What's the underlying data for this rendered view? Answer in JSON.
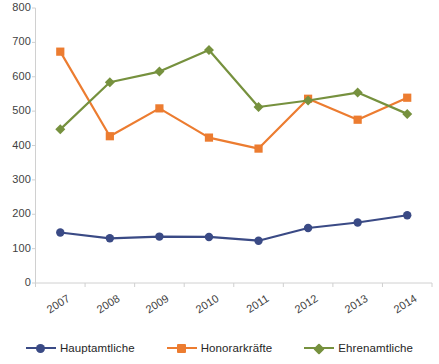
{
  "chart_data": {
    "type": "line",
    "title": "",
    "subtitle": "",
    "xlabel": "",
    "ylabel": "",
    "categories": [
      "2007",
      "2008",
      "2009",
      "2010",
      "2011",
      "2012",
      "2013",
      "2014"
    ],
    "ylim": [
      0,
      800
    ],
    "y_ticks": [
      0,
      100,
      200,
      300,
      400,
      500,
      600,
      700,
      800
    ],
    "y_tick_labels": [
      "0",
      "100",
      "200",
      "300",
      "400",
      "500",
      "600",
      "700",
      "800"
    ],
    "grid": false,
    "legend_position": "bottom",
    "series": [
      {
        "name": "Hauptamtliche",
        "color": "#3a4a85",
        "marker": "circle",
        "values": [
          147,
          130,
          135,
          134,
          123,
          160,
          176,
          197
        ]
      },
      {
        "name": "Honorarkräfte",
        "color": "#ec7c30",
        "marker": "square",
        "values": [
          673,
          427,
          508,
          423,
          391,
          536,
          475,
          539
        ]
      },
      {
        "name": "Ehrenamtliche",
        "color": "#76913e",
        "marker": "diamond",
        "values": [
          447,
          584,
          615,
          678,
          512,
          531,
          554,
          492
        ]
      }
    ]
  },
  "axes": {
    "axis_color": "#d0d0d0",
    "tick_label_color": "#3f3f3f"
  },
  "legend": {
    "entries": [
      {
        "label": "Hauptamtliche",
        "color": "#3a4a85",
        "marker": "circle"
      },
      {
        "label": "Honorarkräfte",
        "color": "#ec7c30",
        "marker": "square"
      },
      {
        "label": "Ehrenamtliche",
        "color": "#76913e",
        "marker": "diamond"
      }
    ]
  }
}
